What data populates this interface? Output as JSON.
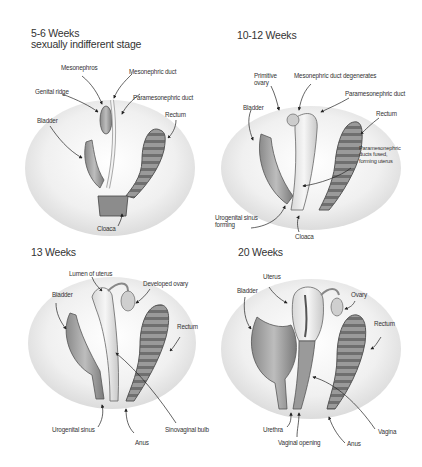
{
  "panels": [
    {
      "title": "5-6 Weeks",
      "subtitle": "sexually indifferent stage",
      "labels": {
        "mesonephros": "Mesonephros",
        "mesonephric_duct": "Mesonephric duct",
        "genital_ridge": "Genital ridge",
        "paramesonephric_duct": "Paramesonephric duct",
        "bladder": "Bladder",
        "rectum": "Rectum",
        "cloaca": "Cloaca"
      }
    },
    {
      "title": "10-12 Weeks",
      "labels": {
        "primitive_ovary": "Primitive ovary",
        "mesonephric_duct_degenerates": "Mesonephric duct degenerates",
        "paramesonephric_duct": "Paramesonephric duct",
        "bladder": "Bladder",
        "rectum": "Rectum",
        "paramesonephric_fused": "Paramesonephric ducts fused, forming uterus",
        "urogenital_sinus_forming": "Urogenital sinus forming",
        "cloaca": "Cloaca"
      }
    },
    {
      "title": "13 Weeks",
      "labels": {
        "lumen_of_uterus": "Lumen of uterus",
        "developed_ovary": "Developed ovary",
        "bladder": "Bladder",
        "rectum": "Rectum",
        "urogenital_sinus": "Urogenital sinus",
        "anus": "Anus",
        "sinovaginal_bulb": "Sinovaginal bulb"
      }
    },
    {
      "title": "20 Weeks",
      "labels": {
        "uterus": "Uterus",
        "bladder": "Bladder",
        "ovary": "Ovary",
        "rectum": "Rectum",
        "urethra": "Urethra",
        "vaginal_opening": "Vaginal opening",
        "anus": "Anus",
        "vagina": "Vagina"
      }
    }
  ]
}
